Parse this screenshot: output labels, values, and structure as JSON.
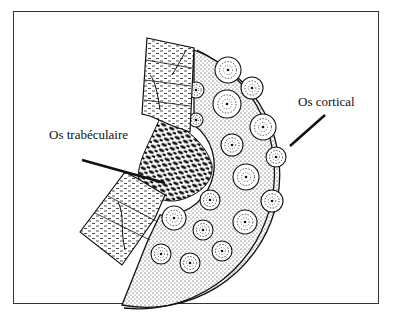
{
  "diagram": {
    "title": "",
    "labels": {
      "cortical": "Os cortical",
      "trabecular": "Os trabéculaire"
    },
    "colors": {
      "ink": "#111111",
      "background": "#ffffff",
      "frame": "#333333"
    },
    "osteons": [
      {
        "cx": 228,
        "cy": 70,
        "r": 13
      },
      {
        "cx": 252,
        "cy": 88,
        "r": 11
      },
      {
        "cx": 227,
        "cy": 104,
        "r": 14
      },
      {
        "cx": 263,
        "cy": 127,
        "r": 13
      },
      {
        "cx": 232,
        "cy": 145,
        "r": 11
      },
      {
        "cx": 276,
        "cy": 157,
        "r": 10
      },
      {
        "cx": 246,
        "cy": 177,
        "r": 13
      },
      {
        "cx": 210,
        "cy": 200,
        "r": 10
      },
      {
        "cx": 272,
        "cy": 201,
        "r": 11
      },
      {
        "cx": 174,
        "cy": 218,
        "r": 12
      },
      {
        "cx": 203,
        "cy": 230,
        "r": 10
      },
      {
        "cx": 245,
        "cy": 222,
        "r": 12
      },
      {
        "cx": 222,
        "cy": 251,
        "r": 10
      },
      {
        "cx": 161,
        "cy": 254,
        "r": 10
      },
      {
        "cx": 190,
        "cy": 263,
        "r": 10
      },
      {
        "cx": 196,
        "cy": 90,
        "r": 8
      },
      {
        "cx": 196,
        "cy": 120,
        "r": 7
      }
    ]
  }
}
